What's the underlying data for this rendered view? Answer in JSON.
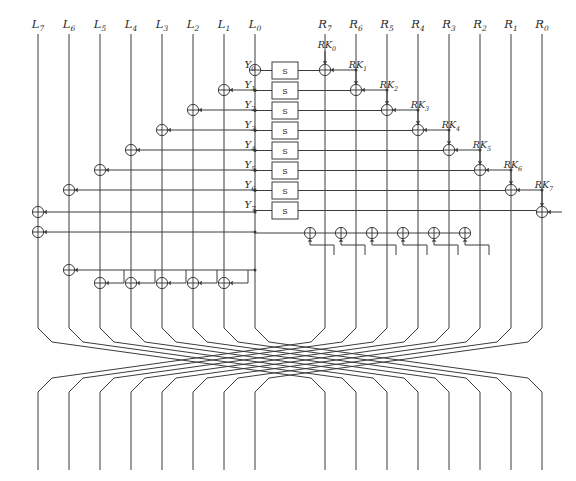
{
  "figure": {
    "kind": "block-cipher-round-diagram",
    "title": "",
    "background_color": "#ffffff",
    "line_color": "#3c3c3c",
    "width": 576,
    "height": 481
  },
  "left_inputs": {
    "name": "left-branch-labels",
    "labels": [
      {
        "base": "L",
        "sub": "7",
        "x": 38
      },
      {
        "base": "L",
        "sub": "6",
        "x": 69
      },
      {
        "base": "L",
        "sub": "5",
        "x": 100
      },
      {
        "base": "L",
        "sub": "4",
        "x": 131
      },
      {
        "base": "L",
        "sub": "3",
        "x": 162
      },
      {
        "base": "L",
        "sub": "2",
        "x": 193
      },
      {
        "base": "L",
        "sub": "1",
        "x": 224
      },
      {
        "base": "L",
        "sub": "0",
        "x": 255
      }
    ]
  },
  "right_inputs": {
    "name": "right-branch-labels",
    "labels": [
      {
        "base": "R",
        "sub": "7",
        "x": 325
      },
      {
        "base": "R",
        "sub": "6",
        "x": 356
      },
      {
        "base": "R",
        "sub": "5",
        "x": 387
      },
      {
        "base": "R",
        "sub": "4",
        "x": 418
      },
      {
        "base": "R",
        "sub": "3",
        "x": 449
      },
      {
        "base": "R",
        "sub": "2",
        "x": 480
      },
      {
        "base": "R",
        "sub": "1",
        "x": 511
      },
      {
        "base": "R",
        "sub": "0",
        "x": 542
      }
    ]
  },
  "sboxes": {
    "name": "substitution-boxes",
    "glyph": "S",
    "count": 8,
    "x": 272,
    "width": 26,
    "height": 17,
    "items": [
      {
        "index": 0,
        "y": 62,
        "label": "S"
      },
      {
        "index": 1,
        "y": 82,
        "label": "S"
      },
      {
        "index": 2,
        "y": 102,
        "label": "S"
      },
      {
        "index": 3,
        "y": 122,
        "label": "S"
      },
      {
        "index": 4,
        "y": 142,
        "label": "S"
      },
      {
        "index": 5,
        "y": 162,
        "label": "S"
      },
      {
        "index": 6,
        "y": 182,
        "label": "S"
      },
      {
        "index": 7,
        "y": 202,
        "label": "S"
      }
    ]
  },
  "y_labels": {
    "name": "sbox-input-labels",
    "items": [
      {
        "base": "Y",
        "sub": "0",
        "x": 250,
        "y": 68
      },
      {
        "base": "Y",
        "sub": "1",
        "x": 250,
        "y": 88
      },
      {
        "base": "Y",
        "sub": "2",
        "x": 250,
        "y": 108
      },
      {
        "base": "Y",
        "sub": "3",
        "x": 250,
        "y": 128
      },
      {
        "base": "Y",
        "sub": "4",
        "x": 250,
        "y": 148
      },
      {
        "base": "Y",
        "sub": "5",
        "x": 250,
        "y": 168
      },
      {
        "base": "Y",
        "sub": "6",
        "x": 250,
        "y": 188
      },
      {
        "base": "Y",
        "sub": "7",
        "x": 250,
        "y": 208
      }
    ]
  },
  "round_keys": {
    "name": "round-key-labels",
    "items": [
      {
        "base": "RK",
        "sub": "0",
        "label_x": 327,
        "label_y": 48,
        "xor_x": 325,
        "xor_y": 70
      },
      {
        "base": "RK",
        "sub": "1",
        "label_x": 358,
        "label_y": 68,
        "xor_x": 356,
        "xor_y": 90
      },
      {
        "base": "RK",
        "sub": "2",
        "label_x": 389,
        "label_y": 88,
        "xor_x": 387,
        "xor_y": 110
      },
      {
        "base": "RK",
        "sub": "3",
        "label_x": 420,
        "label_y": 108,
        "xor_x": 418,
        "xor_y": 130
      },
      {
        "base": "RK",
        "sub": "4",
        "label_x": 451,
        "label_y": 128,
        "xor_x": 449,
        "xor_y": 150
      },
      {
        "base": "RK",
        "sub": "5",
        "label_x": 482,
        "label_y": 148,
        "xor_x": 480,
        "xor_y": 170
      },
      {
        "base": "RK",
        "sub": "6",
        "label_x": 513,
        "label_y": 168,
        "xor_x": 511,
        "xor_y": 190
      },
      {
        "base": "RK",
        "sub": "7",
        "label_x": 544,
        "label_y": 188,
        "xor_x": 542,
        "xor_y": 212
      }
    ]
  },
  "left_xors": {
    "name": "left-branch-xor-gates",
    "description": "descending staircase of XOR gates fed from the S-box outputs",
    "items": [
      {
        "x": 255,
        "y": 70
      },
      {
        "x": 224,
        "y": 90
      },
      {
        "x": 193,
        "y": 110
      },
      {
        "x": 162,
        "y": 130
      },
      {
        "x": 131,
        "y": 150
      },
      {
        "x": 100,
        "y": 170
      },
      {
        "x": 69,
        "y": 190
      },
      {
        "x": 38,
        "y": 212
      },
      {
        "x": 38,
        "y": 232
      }
    ]
  },
  "left_bottom_xors": {
    "name": "left-bottom-xor-row",
    "hook_y": 270,
    "row_y": 283,
    "lead": {
      "x": 69,
      "y": 270
    },
    "items": [
      {
        "x": 100,
        "y": 283
      },
      {
        "x": 131,
        "y": 283
      },
      {
        "x": 162,
        "y": 283
      },
      {
        "x": 193,
        "y": 283
      },
      {
        "x": 224,
        "y": 283
      }
    ]
  },
  "right_bottom_xors": {
    "name": "right-bottom-xor-row",
    "row_y": 233,
    "items": [
      {
        "x": 310,
        "y": 233
      },
      {
        "x": 341,
        "y": 233
      },
      {
        "x": 372,
        "y": 233
      },
      {
        "x": 403,
        "y": 233
      },
      {
        "x": 434,
        "y": 233
      },
      {
        "x": 465,
        "y": 233
      }
    ]
  },
  "permutation": {
    "name": "branch-swap-network",
    "description": "left half wires cross to the right half and right half wires cross to the left half",
    "top_y": 320,
    "bottom_y": 400,
    "end_y": 470,
    "left_x": [
      38,
      69,
      100,
      131,
      162,
      193,
      224,
      255
    ],
    "right_x": [
      325,
      356,
      387,
      418,
      449,
      480,
      511,
      542
    ]
  }
}
